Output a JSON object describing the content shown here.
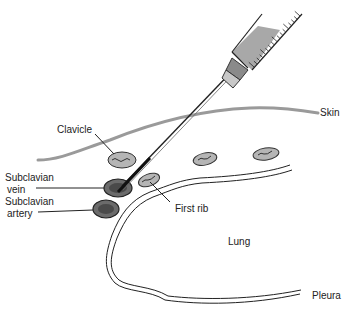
{
  "diagram": {
    "labels": {
      "skin": "Skin",
      "clavicle": "Clavicle",
      "subclavian_vein_line1": "Subclavian",
      "subclavian_vein_line2": "vein",
      "subclavian_artery_line1": "Subclavian",
      "subclavian_artery_line2": "artery",
      "first_rib": "First rib",
      "lung": "Lung",
      "pleura": "Pleura"
    },
    "colors": {
      "skin": "#9a9a9a",
      "bone_fill": "#b5b5b5",
      "vessel_fill": "#6b6b6b",
      "syringe_fill": "#a8a8a8",
      "line": "#222222"
    }
  }
}
